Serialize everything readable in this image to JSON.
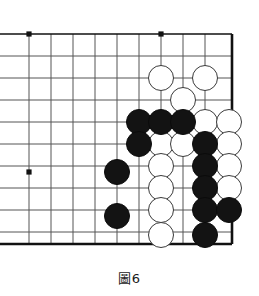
{
  "figure": {
    "caption": "圖6",
    "caption_label": "figure-6"
  },
  "board": {
    "title": "Go board corner diagram",
    "grid": {
      "x_lines": [
        29,
        51,
        73,
        95,
        117,
        139,
        161,
        183,
        205
      ],
      "y_lines": [
        34,
        56,
        78,
        100,
        122,
        144,
        166,
        188,
        210,
        232
      ],
      "spacing": 22,
      "line_color": "#555555",
      "line_width": 1,
      "edge_color": "#111111",
      "edge_width": 2.6,
      "right_edge_x": 232,
      "bottom_edge_y": 244,
      "top_edge_y": 34,
      "left_open": true
    },
    "star_points": [
      {
        "x": 29,
        "y": 34
      },
      {
        "x": 161,
        "y": 34
      },
      {
        "x": 29,
        "y": 172
      }
    ],
    "star_point_radius": 2.6,
    "star_point_color": "#111111",
    "stone_radius": 13,
    "colors": {
      "black_fill": "#131313",
      "white_fill": "#ffffff",
      "white_stroke": "#3a3a3a",
      "background": "#ffffff"
    },
    "stones": [
      {
        "color": "white",
        "x": 161,
        "y": 78
      },
      {
        "color": "white",
        "x": 205,
        "y": 78
      },
      {
        "color": "white",
        "x": 183,
        "y": 100
      },
      {
        "color": "black",
        "x": 139,
        "y": 122
      },
      {
        "color": "black",
        "x": 161,
        "y": 122
      },
      {
        "color": "black",
        "x": 183,
        "y": 122
      },
      {
        "color": "white",
        "x": 205,
        "y": 122
      },
      {
        "color": "white",
        "x": 229,
        "y": 122
      },
      {
        "color": "black",
        "x": 139,
        "y": 144
      },
      {
        "color": "white",
        "x": 161,
        "y": 144
      },
      {
        "color": "white",
        "x": 183,
        "y": 144
      },
      {
        "color": "black",
        "x": 205,
        "y": 144
      },
      {
        "color": "white",
        "x": 229,
        "y": 144
      },
      {
        "color": "black",
        "x": 117,
        "y": 172
      },
      {
        "color": "white",
        "x": 161,
        "y": 166
      },
      {
        "color": "black",
        "x": 205,
        "y": 166
      },
      {
        "color": "white",
        "x": 229,
        "y": 166
      },
      {
        "color": "white",
        "x": 161,
        "y": 188
      },
      {
        "color": "black",
        "x": 205,
        "y": 188
      },
      {
        "color": "white",
        "x": 229,
        "y": 188
      },
      {
        "color": "black",
        "x": 117,
        "y": 216
      },
      {
        "color": "white",
        "x": 161,
        "y": 210
      },
      {
        "color": "black",
        "x": 205,
        "y": 210
      },
      {
        "color": "black",
        "x": 229,
        "y": 210
      },
      {
        "color": "white",
        "x": 161,
        "y": 235
      },
      {
        "color": "black",
        "x": 205,
        "y": 235
      }
    ]
  }
}
